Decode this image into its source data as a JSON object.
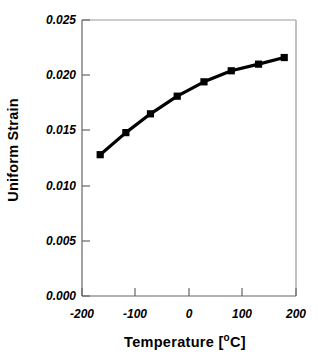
{
  "chart_data": {
    "type": "line",
    "title": "",
    "subtitle": "",
    "xlabel": "Temperature  [°C]",
    "xlabel_main": "Temperature  [",
    "xlabel_deg": "o",
    "xlabel_tail": "C]",
    "ylabel": "Uniform Strain",
    "xlim": [
      -200,
      200
    ],
    "ylim": [
      0.0,
      0.025
    ],
    "xticks": [
      -200,
      -100,
      0,
      100,
      200
    ],
    "xtick_labels": [
      "-200",
      "-100",
      "0",
      "100",
      "200"
    ],
    "yticks": [
      0.0,
      0.005,
      0.01,
      0.015,
      0.02,
      0.025
    ],
    "ytick_labels": [
      "0.000",
      "0.005",
      "0.010",
      "0.015",
      "0.020",
      "0.025"
    ],
    "grid": false,
    "legend": null,
    "marker": "square",
    "line_color": "#000000",
    "marker_color": "#000000",
    "frame_color": "#808080",
    "background": "#ffffff",
    "series": [
      {
        "name": "Uniform Strain",
        "x": [
          -166,
          -118,
          -72,
          -22,
          28,
          79,
          130,
          178
        ],
        "values": [
          0.0128,
          0.0148,
          0.0165,
          0.0181,
          0.0194,
          0.0204,
          0.021,
          0.0216
        ]
      }
    ]
  },
  "axes": {
    "y_title": "Uniform Strain"
  }
}
